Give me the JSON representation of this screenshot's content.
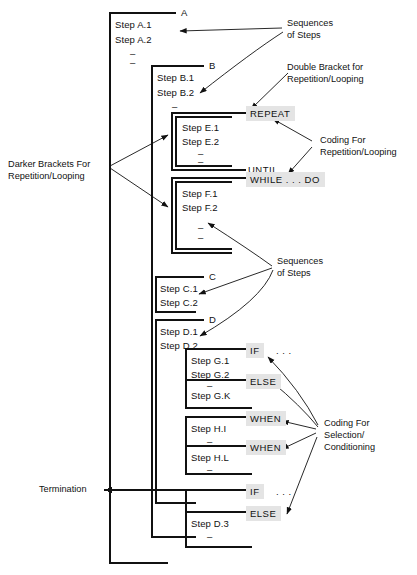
{
  "diagram": {
    "background": "#ffffff",
    "ink": "#111111",
    "keyword_shade": "#e4e4e4",
    "dash_glyph": "–"
  },
  "brackets": [
    {
      "tag": "A",
      "steps": [
        "Step A.1",
        "Step A.2"
      ],
      "dashes": 2,
      "style": "single"
    },
    {
      "tag": "B",
      "steps": [
        "Step B.1",
        "Step B.2"
      ],
      "dashes": 1,
      "style": "single"
    },
    {
      "tag": "E",
      "steps": [
        "Step E.1",
        "Step E.2"
      ],
      "dashes": 2,
      "style": "double"
    },
    {
      "tag": "F",
      "steps": [
        "Step F.1",
        "Step F.2"
      ],
      "dashes": 2,
      "style": "double"
    },
    {
      "tag": "C",
      "steps": [
        "Step C.1",
        "Step C.2"
      ],
      "dashes": 0,
      "style": "single"
    },
    {
      "tag": "D",
      "steps": [
        "Step D.1",
        "Step D.2"
      ],
      "dashes": 0,
      "style": "single"
    },
    {
      "tag": "G",
      "steps": [
        "Step G.1",
        "Step G.2",
        "Step G.K"
      ],
      "dashes": 1,
      "style": "single"
    },
    {
      "tag": "H",
      "steps": [
        "Step H.I",
        "Step H.L"
      ],
      "dashes": 2,
      "style": "single"
    },
    {
      "tag": "D3",
      "steps": [
        "Step D.3"
      ],
      "dashes": 2,
      "style": "single"
    }
  ],
  "steps": {
    "a1": "Step A.1",
    "a2": "Step A.2",
    "b1": "Step B.1",
    "b2": "Step B.2",
    "e1": "Step E.1",
    "e2": "Step E.2",
    "f1": "Step F.1",
    "f2": "Step F.2",
    "c1": "Step C.1",
    "c2": "Step C.2",
    "d1": "Step D.1",
    "d2": "Step D.2",
    "g1": "Step G.1",
    "g2": "Step G.2",
    "gk": "Step G.K",
    "hi": "Step H.I",
    "hl": "Step H.L",
    "d3": "Step D.3"
  },
  "tags": {
    "a": "A",
    "b": "B",
    "c": "C",
    "d": "D"
  },
  "keywords": {
    "repeat": {
      "label": "REPEAT",
      "shaded": true
    },
    "until": {
      "label": "UNTIL . . .",
      "shaded": false
    },
    "while_do": {
      "label": "WHILE . . . DO",
      "shaded": true
    },
    "if_top": {
      "label": "IF",
      "shaded": true
    },
    "if_top_dots": {
      "label": ". . .",
      "shaded": false
    },
    "else_top": {
      "label": "ELSE",
      "shaded": true
    },
    "when_1": {
      "label": "WHEN",
      "shaded": true
    },
    "when_2": {
      "label": "WHEN",
      "shaded": true
    },
    "if_bottom": {
      "label": "IF",
      "shaded": true
    },
    "if_bottom_dots": {
      "label": ". . .",
      "shaded": false
    },
    "else_bottom": {
      "label": "ELSE",
      "shaded": true
    }
  },
  "annotations": {
    "sequences_top": "Sequences\nof Steps",
    "double_bracket": "Double Bracket for\nRepetition/Looping",
    "coding_repetition": "Coding For\nRepetition/Looping",
    "darker_brackets": "Darker Brackets For\nRepetition/Looping",
    "sequences_mid": "Sequences\nof Steps",
    "coding_selection": "Coding For\nSelection/\nConditioning",
    "termination": "Termination"
  }
}
